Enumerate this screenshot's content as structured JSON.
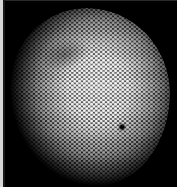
{
  "image": {
    "subject": "hexagonal-lattice-micrograph",
    "background_color": "#000000",
    "lattice_color": "#ffffff",
    "defect": {
      "x": 122,
      "y": 127,
      "color": "#050505"
    }
  }
}
